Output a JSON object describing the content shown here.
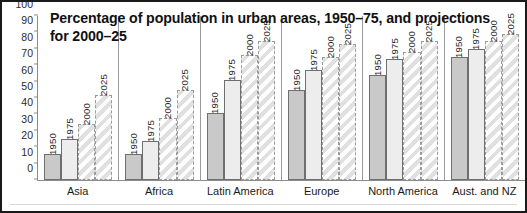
{
  "chart_data": {
    "type": "bar",
    "title": "Percentage of population in urban areas, 1950–75, and projections for 2000–25",
    "xlabel": "",
    "ylabel": "",
    "ylim": [
      0,
      100
    ],
    "ytick_step": 10,
    "yticks": [
      "100",
      "90",
      "80",
      "70",
      "60",
      "50",
      "40",
      "30",
      "20",
      "10",
      "0"
    ],
    "grid": false,
    "legend": "none (year labelled on each bar)",
    "categories": [
      "Asia",
      "Africa",
      "Latin America",
      "Europe",
      "North America",
      "Aust. and NZ"
    ],
    "series": [
      {
        "name": "1950",
        "kind": "historical",
        "values": [
          16,
          16,
          41,
          55,
          64,
          75
        ]
      },
      {
        "name": "1975",
        "kind": "historical",
        "values": [
          25,
          24,
          61,
          67,
          74,
          80
        ]
      },
      {
        "name": "2000",
        "kind": "projection",
        "values": [
          34,
          38,
          76,
          75,
          78,
          85
        ]
      },
      {
        "name": "2025",
        "kind": "projection",
        "values": [
          52,
          55,
          85,
          83,
          85,
          89
        ]
      }
    ],
    "colors": {
      "bar_1950_fill": "#c9c9c9",
      "bar_1975_fill": "#ededed",
      "projection_hatch": "#e0e0e0",
      "bar_outline": "#6f6f6f",
      "projection_outline": "#9a9a9a",
      "axis": "#8c8c8c",
      "frame": "#1a1a1a",
      "text": "#111111"
    }
  }
}
